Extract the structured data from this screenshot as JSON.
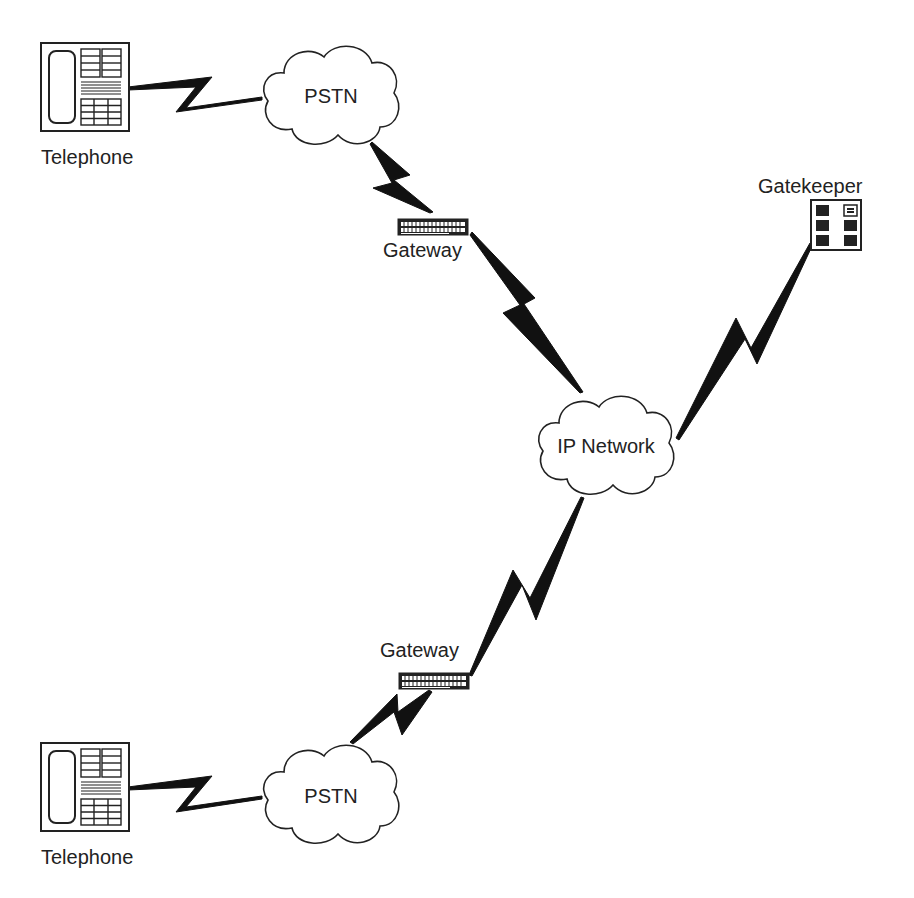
{
  "diagram": {
    "title": "",
    "nodes": [
      {
        "id": "telephone_top",
        "type": "telephone",
        "label": "Telephone"
      },
      {
        "id": "pstn_top",
        "type": "cloud",
        "label": "PSTN"
      },
      {
        "id": "gateway_top",
        "type": "gateway",
        "label": "Gateway"
      },
      {
        "id": "ip_network",
        "type": "cloud",
        "label": "IP Network"
      },
      {
        "id": "gatekeeper",
        "type": "gatekeeper",
        "label": "Gatekeeper"
      },
      {
        "id": "gateway_bottom",
        "type": "gateway",
        "label": "Gateway"
      },
      {
        "id": "pstn_bottom",
        "type": "cloud",
        "label": "PSTN"
      },
      {
        "id": "telephone_bottom",
        "type": "telephone",
        "label": "Telephone"
      }
    ],
    "links": [
      {
        "from": "telephone_top",
        "to": "pstn_top",
        "style": "lightning"
      },
      {
        "from": "pstn_top",
        "to": "gateway_top",
        "style": "lightning"
      },
      {
        "from": "gateway_top",
        "to": "ip_network",
        "style": "lightning"
      },
      {
        "from": "ip_network",
        "to": "gatekeeper",
        "style": "lightning"
      },
      {
        "from": "ip_network",
        "to": "gateway_bottom",
        "style": "lightning"
      },
      {
        "from": "gateway_bottom",
        "to": "pstn_bottom",
        "style": "lightning"
      },
      {
        "from": "pstn_bottom",
        "to": "telephone_bottom",
        "style": "lightning"
      }
    ],
    "colors": {
      "stroke": "#222222",
      "fill": "#ffffff",
      "text": "#222222"
    }
  },
  "labels": {
    "telephone_top": "Telephone",
    "pstn_top": "PSTN",
    "gateway_top": "Gateway",
    "gatekeeper": "Gatekeeper",
    "ip_network": "IP Network",
    "gateway_bottom": "Gateway",
    "pstn_bottom": "PSTN",
    "telephone_bottom": "Telephone"
  }
}
